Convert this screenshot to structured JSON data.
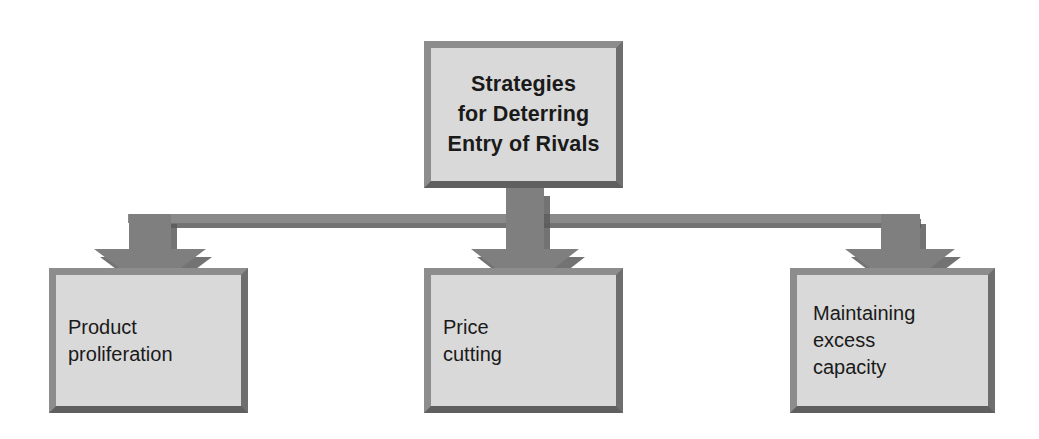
{
  "diagram": {
    "title": "Strategies for Deterring Entry of Rivals",
    "type": "hierarchy-tree",
    "orientation": "top-down",
    "colors": {
      "box_fill": "#d9d9d9",
      "box_border_light": "#8d8d8d",
      "box_border_dark": "#5f5f5f",
      "connector": "#808080",
      "connector_shadow": "#5a5a5a",
      "text": "#1a1a1a",
      "background": "#ffffff"
    },
    "root": {
      "id": "root",
      "label": "Strategies\nfor Deterring\nEntry of Rivals",
      "bold": true
    },
    "branches": [
      {
        "id": "branch-product-proliferation",
        "label": "Product\nproliferation",
        "arrow_name": "arrow-to-product-proliferation"
      },
      {
        "id": "branch-price-cutting",
        "label": "Price\ncutting",
        "arrow_name": "arrow-to-price-cutting"
      },
      {
        "id": "branch-maintaining-excess-capacity",
        "label": "Maintaining\nexcess\ncapacity",
        "arrow_name": "arrow-to-maintaining-excess-capacity"
      }
    ],
    "connector": {
      "horizontal_bar_label": "horizontal-distribution-bar",
      "stem_label": "root-vertical-stem"
    }
  }
}
